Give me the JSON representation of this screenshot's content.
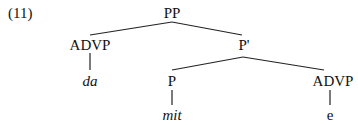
{
  "example_number": "(11)",
  "tree": {
    "root": "PP",
    "advp_left": "ADVP",
    "da": "da",
    "p_bar": "P'",
    "p": "P",
    "mit": "mit",
    "advp_right": "ADVP",
    "trace": "e"
  }
}
